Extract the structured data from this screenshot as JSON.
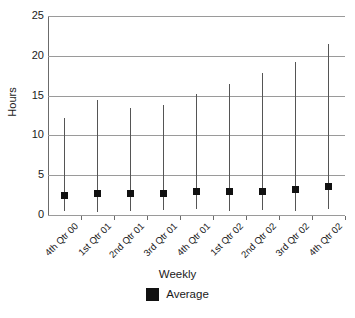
{
  "chart_data": {
    "type": "scatter",
    "title": "",
    "subtitle": "",
    "xlabel": "Weekly",
    "ylabel": "Hours",
    "ylim": [
      0,
      25
    ],
    "yticks": [
      0,
      5,
      10,
      15,
      20,
      25
    ],
    "ytick_labels": [
      "0",
      "5",
      "10",
      "15",
      "20",
      "25"
    ],
    "grid": true,
    "grid_axis": "y",
    "legend_position": "bottom-center",
    "legend": [
      "Average"
    ],
    "categories": [
      "4th Qtr 00",
      "1st Qtr 01",
      "2nd Qtr 01",
      "3rd Qtr 01",
      "4th Qtr 01",
      "1st Qtr 02",
      "2nd Qtr 02",
      "3rd Qtr 02",
      "4th Qtr 02"
    ],
    "series": [
      {
        "name": "Average",
        "marker": "square",
        "color": "#111111",
        "values": [
          2.5,
          2.7,
          2.7,
          2.7,
          3.0,
          2.9,
          2.9,
          3.2,
          3.6
        ]
      }
    ],
    "error_bars": {
      "name": "Range",
      "color": "#555555",
      "low": [
        0.5,
        0.4,
        0.5,
        0.6,
        0.7,
        0.5,
        0.6,
        0.5,
        0.7
      ],
      "high": [
        12.2,
        14.5,
        13.5,
        13.8,
        15.2,
        16.5,
        17.9,
        19.2,
        21.5
      ]
    },
    "annotations": []
  },
  "colors": {
    "marker": "#111111",
    "errorbar": "#555555",
    "gridline": "#9a9a9a",
    "axis": "#6b6b6b",
    "background": "#ffffff",
    "text": "#1a1a1a"
  }
}
